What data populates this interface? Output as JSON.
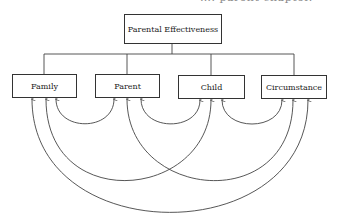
{
  "header_fragment": "…. parent chapter.",
  "diagram": {
    "root": {
      "label": "Parental Effectiveness"
    },
    "factors": [
      {
        "label": "Family"
      },
      {
        "label": "Parent"
      },
      {
        "label": "Child"
      },
      {
        "label": "Circumstance"
      }
    ],
    "interactions": [
      {
        "from": "Family",
        "to": "Parent"
      },
      {
        "from": "Parent",
        "to": "Child"
      },
      {
        "from": "Child",
        "to": "Circumstance"
      },
      {
        "from": "Family",
        "to": "Child"
      },
      {
        "from": "Parent",
        "to": "Circumstance"
      },
      {
        "from": "Family",
        "to": "Circumstance"
      }
    ],
    "line_color": "#444444"
  }
}
